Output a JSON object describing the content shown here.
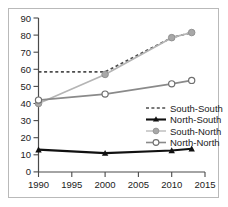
{
  "chart_data": {
    "type": "line",
    "title": "",
    "xlabel": "",
    "ylabel": "",
    "x": [
      1990,
      2000,
      2010,
      2013
    ],
    "xlim": [
      1990,
      2015
    ],
    "ylim": [
      0,
      90
    ],
    "xticks": [
      1990,
      1995,
      2000,
      2005,
      2010,
      2015
    ],
    "yticks": [
      0,
      10,
      20,
      30,
      40,
      50,
      60,
      70,
      80,
      90
    ],
    "grid": false,
    "legend_position": "center-right",
    "series": [
      {
        "name": "South-South",
        "x": [
          1990,
          2000,
          2010,
          2013
        ],
        "values": [
          58.5,
          58.5,
          78.5,
          81.5
        ],
        "color": "#4d4d4d",
        "style": "dashed",
        "marker": "none"
      },
      {
        "name": "North-South",
        "x": [
          1990,
          2000,
          2010,
          2013
        ],
        "values": [
          13.0,
          11.0,
          12.5,
          13.5
        ],
        "color": "#111111",
        "style": "solid",
        "marker": "filled-triangle"
      },
      {
        "name": "South-North",
        "x": [
          1990,
          2000,
          2010,
          2013
        ],
        "values": [
          40.0,
          57.0,
          78.5,
          81.5
        ],
        "color": "#b5b5b5",
        "style": "solid",
        "marker": "filled-circle"
      },
      {
        "name": "North-North",
        "x": [
          1990,
          2000,
          2010,
          2013
        ],
        "values": [
          42.0,
          45.5,
          51.5,
          53.5
        ],
        "color": "#8a8a8a",
        "style": "solid",
        "marker": "open-circle"
      }
    ]
  },
  "axis": {
    "x_tick_labels": [
      "1990",
      "1995",
      "2000",
      "2005",
      "2010",
      "2015"
    ],
    "y_tick_labels": [
      "0",
      "10",
      "20",
      "30",
      "40",
      "50",
      "60",
      "70",
      "80",
      "90"
    ]
  },
  "legend": {
    "entries": [
      {
        "label": "South-South"
      },
      {
        "label": "North-South"
      },
      {
        "label": "South-North"
      },
      {
        "label": "North-North"
      }
    ]
  },
  "colors": {
    "axis": "#4a4a4a",
    "frame": "#b9b9b9",
    "text": "#222222",
    "south_south": "#4d4d4d",
    "north_south": "#111111",
    "south_north": "#b5b5b5",
    "north_north": "#8a8a8a"
  }
}
